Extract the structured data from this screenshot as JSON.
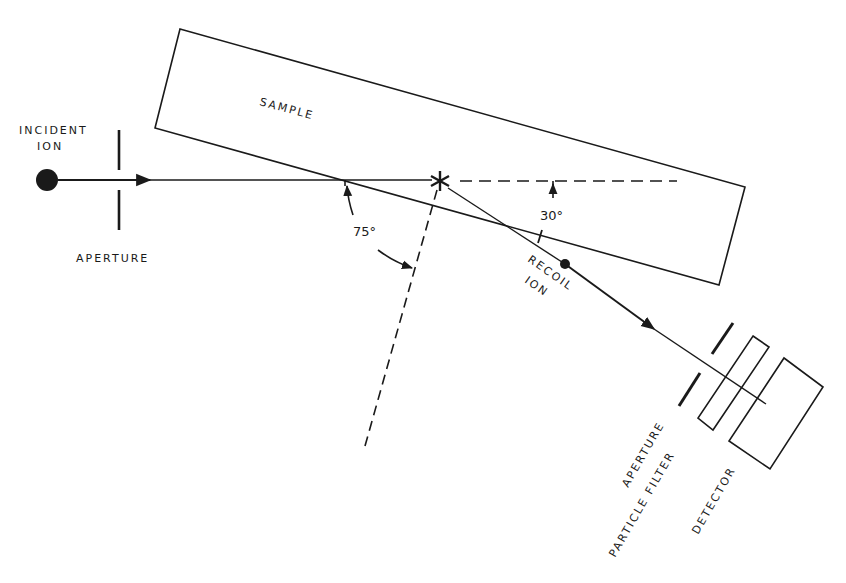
{
  "diagram": {
    "type": "experimental-setup",
    "labels": {
      "incident_line1": "INCIDENT",
      "incident_line2": "ION",
      "aperture_left": "APERTURE",
      "sample": "SAMPLE",
      "recoil_line1": "RECOIL",
      "recoil_line2": "ION",
      "angle_incident": "75°",
      "angle_recoil": "30°",
      "aperture_right": "APERTURE",
      "particle_filter": "PARTICLE FILTER",
      "detector": "DETECTOR"
    },
    "colors": {
      "ink": "#1a1a1a",
      "background": "#ffffff"
    }
  }
}
